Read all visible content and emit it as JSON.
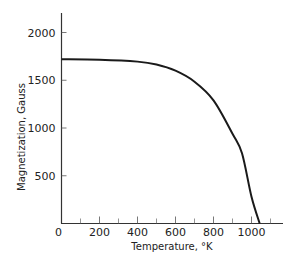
{
  "chart_data": {
    "type": "line",
    "title": "",
    "xlabel": "Temperature, °K",
    "ylabel": "Magnetization, Gauss",
    "xlim": [
      0,
      1150
    ],
    "ylim": [
      0,
      2200
    ],
    "x_ticks_major": [
      0,
      200,
      400,
      600,
      800,
      1000
    ],
    "x_ticks_minor": [
      100,
      300,
      500,
      700,
      900,
      1100
    ],
    "x_tick_labels": [
      "0",
      "200",
      "400",
      "600",
      "800",
      "1000"
    ],
    "y_ticks": [
      500,
      1000,
      1500,
      2000
    ],
    "y_tick_labels": [
      "500",
      "1000",
      "1500",
      "2000"
    ],
    "grid": false,
    "legend": null,
    "series": [
      {
        "name": "Magnetization vs Temperature",
        "color": "#1a1a1a",
        "x": [
          0,
          200,
          400,
          500,
          600,
          700,
          800,
          900,
          950,
          1000,
          1043
        ],
        "y": [
          1720,
          1715,
          1695,
          1665,
          1600,
          1485,
          1290,
          940,
          735,
          280,
          0
        ]
      }
    ]
  }
}
